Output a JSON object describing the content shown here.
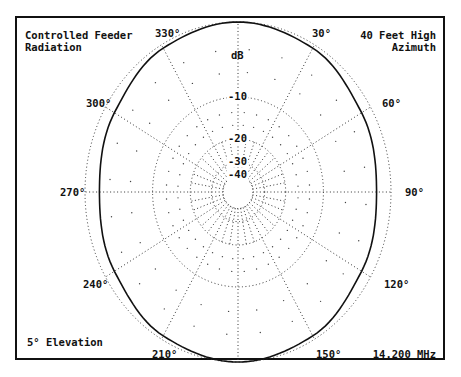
{
  "chart_data": {
    "type": "polar",
    "title_lines": [
      "Controlled Feeder",
      "Radiation"
    ],
    "subtitle_lines": [
      "40 Feet High",
      "Azimuth"
    ],
    "footnote_left": "5° Elevation",
    "footnote_right": "14.200 MHz",
    "radial_unit_label": "dB",
    "radial_scale": "ARRL log periodic",
    "radial_ticks": [
      {
        "value": -10,
        "label": "-10"
      },
      {
        "value": -20,
        "label": "-20"
      },
      {
        "value": -30,
        "label": "-30"
      },
      {
        "value": -40,
        "label": "-40"
      }
    ],
    "radial_range_db": [
      -40,
      0
    ],
    "angle_labels": [
      {
        "deg": 330,
        "label": "330°"
      },
      {
        "deg": 30,
        "label": "30°"
      },
      {
        "deg": 300,
        "label": "300°"
      },
      {
        "deg": 60,
        "label": "60°"
      },
      {
        "deg": 270,
        "label": "270°"
      },
      {
        "deg": 90,
        "label": "90°"
      },
      {
        "deg": 240,
        "label": "240°"
      },
      {
        "deg": 120,
        "label": "120°"
      },
      {
        "deg": 210,
        "label": "210°"
      },
      {
        "deg": 150,
        "label": "150°"
      }
    ],
    "grid": true,
    "series": [
      {
        "name": "Controlled Feeder Radiation",
        "angles_deg": [
          0,
          30,
          60,
          90,
          120,
          150,
          180,
          210,
          240,
          270,
          300,
          330,
          360
        ],
        "values_db": [
          0,
          -0.4,
          -1.2,
          -1.7,
          -1.2,
          -0.4,
          0,
          -0.4,
          -1.2,
          -1.7,
          -1.2,
          -0.4,
          0
        ]
      }
    ]
  }
}
